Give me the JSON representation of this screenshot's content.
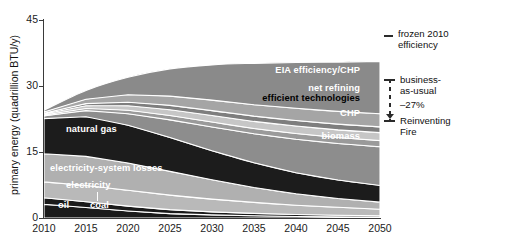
{
  "chart_data": {
    "type": "area",
    "title": "",
    "subtitle": "",
    "xlabel": "",
    "ylabel": "primary energy (quadrillion BTU/y)",
    "xlim": [
      2010,
      2050
    ],
    "ylim": [
      0,
      45
    ],
    "yticks": [
      0,
      15,
      30,
      45
    ],
    "xticks": [
      2010,
      2015,
      2020,
      2025,
      2030,
      2035,
      2040,
      2045,
      2050
    ],
    "grid": false,
    "legend_position": "right",
    "stacked": true,
    "x": [
      2010,
      2015,
      2020,
      2025,
      2030,
      2035,
      2040,
      2045,
      2050
    ],
    "series": [
      {
        "name": "coal",
        "label": "coal",
        "color": "#1a1a1a",
        "label_color": "#ffffff",
        "values": [
          3.1,
          2.4,
          1.6,
          1.0,
          0.7,
          0.5,
          0.35,
          0.25,
          0.2
        ]
      },
      {
        "name": "oil",
        "label": "oil",
        "color": "#1a1a1a",
        "label_color": "#ffffff",
        "values": [
          1.5,
          1.3,
          1.1,
          0.9,
          0.7,
          0.55,
          0.45,
          0.38,
          0.3
        ]
      },
      {
        "name": "electricity",
        "label": "electricity",
        "color": "#b9b9b9",
        "label_color": "#ffffff",
        "values": [
          3.6,
          3.7,
          3.6,
          3.3,
          2.9,
          2.5,
          2.1,
          1.8,
          1.5
        ]
      },
      {
        "name": "electricity-system losses",
        "label": "electricity-system losses",
        "color": "#b0b0b0",
        "label_color": "#ffffff",
        "values": [
          6.4,
          6.6,
          6.2,
          5.4,
          4.4,
          3.4,
          2.6,
          2.0,
          1.6
        ]
      },
      {
        "name": "natural gas",
        "label": "natural gas",
        "color": "#1c1c1c",
        "label_color": "#ffffff",
        "values": [
          8.0,
          9.0,
          8.6,
          7.7,
          6.6,
          5.6,
          4.8,
          4.2,
          3.8
        ]
      },
      {
        "name": "biomass",
        "label": "biomass",
        "color": "#8d8d8d",
        "label_color": "#ffffff",
        "values": [
          0.6,
          1.4,
          2.6,
          4.0,
          5.4,
          6.6,
          7.6,
          8.3,
          8.8
        ]
      },
      {
        "name": "CHP",
        "label": "CHP",
        "color": "#9a9a9a",
        "label_color": "#ffffff",
        "values": [
          0.2,
          0.5,
          0.8,
          1.0,
          1.1,
          1.2,
          1.3,
          1.35,
          1.4
        ]
      },
      {
        "name": "efficient technologies",
        "label": "efficient technologies",
        "color": "#c6c6c6",
        "label_color": "#000000",
        "values": [
          0.2,
          0.6,
          1.0,
          1.3,
          1.5,
          1.6,
          1.7,
          1.75,
          1.8
        ]
      },
      {
        "name": "net refining",
        "label": "net refining",
        "color": "#7e7e7e",
        "label_color": "#ffffff",
        "values": [
          0.2,
          0.5,
          0.8,
          1.0,
          1.1,
          1.2,
          1.25,
          1.3,
          1.3
        ]
      },
      {
        "name": "EIA efficiency/CHP",
        "label": "EIA efficiency/CHP",
        "color": "#a5a5a5",
        "label_color": "#ffffff",
        "values": [
          0.3,
          1.0,
          1.7,
          2.1,
          2.4,
          2.6,
          2.8,
          2.9,
          3.0
        ]
      },
      {
        "name": "EIA structural changes",
        "label": "EIA structural changes",
        "color": "#8a8a8a",
        "label_color": "#ffffff",
        "values": [
          0.4,
          2.0,
          4.0,
          6.2,
          8.0,
          9.4,
          10.4,
          11.2,
          11.9
        ]
      }
    ],
    "totals": [
      24.5,
      29.0,
      32.0,
      33.9,
      34.8,
      35.1,
      35.3,
      35.4,
      35.6
    ],
    "annotations": [
      {
        "name": "frozen-2010-efficiency",
        "text": "frozen 2010\nefficiency",
        "marker": "dash"
      },
      {
        "name": "business-as-usual",
        "text": "business-\nas-usual",
        "marker": "bracket-top"
      },
      {
        "name": "reduction-pct",
        "text": "–27%",
        "marker": "bracket-stem"
      },
      {
        "name": "reinventing-fire",
        "text": "Reinventing\nFire",
        "marker": "bracket-bottom"
      }
    ]
  },
  "axes": {
    "ytitle": "primary energy (quadrillion BTU/y)",
    "yticks": [
      "45",
      "30",
      "15",
      "0"
    ],
    "xticks": [
      "2010",
      "2015",
      "2020",
      "2025",
      "2030",
      "2035",
      "2040",
      "2045",
      "2050"
    ]
  },
  "band_labels": [
    {
      "name": "eia-structural-changes",
      "text": "EIA structural changes",
      "x": 360,
      "y": 44,
      "anchor": "end",
      "tone": "white"
    },
    {
      "name": "eia-efficiency-chp",
      "text": "EIA efficiency/CHP",
      "x": 360,
      "y": 71,
      "anchor": "end",
      "tone": "white"
    },
    {
      "name": "net-refining",
      "text": "net refining",
      "x": 360,
      "y": 89,
      "anchor": "end",
      "tone": "white"
    },
    {
      "name": "efficient-technologies",
      "text": "efficient technologies",
      "x": 360,
      "y": 99,
      "anchor": "end",
      "tone": "black"
    },
    {
      "name": "chp",
      "text": "CHP",
      "x": 360,
      "y": 114,
      "anchor": "end",
      "tone": "white"
    },
    {
      "name": "biomass",
      "text": "biomass",
      "x": 360,
      "y": 137,
      "anchor": "end",
      "tone": "white"
    },
    {
      "name": "natural-gas",
      "text": "natural gas",
      "x": 66,
      "y": 130,
      "anchor": "start",
      "tone": "white"
    },
    {
      "name": "electricity-system-losses",
      "text": "electricity-system losses",
      "x": 50,
      "y": 169,
      "anchor": "start",
      "tone": "white"
    },
    {
      "name": "electricity",
      "text": "electricity",
      "x": 66,
      "y": 186,
      "anchor": "start",
      "tone": "white"
    },
    {
      "name": "oil",
      "text": "oil",
      "x": 58,
      "y": 206,
      "anchor": "start",
      "tone": "white"
    },
    {
      "name": "coal",
      "text": "coal",
      "x": 90,
      "y": 206,
      "anchor": "start",
      "tone": "white"
    }
  ],
  "legend": {
    "frozen_efficiency": "frozen 2010\nefficiency",
    "business_as_usual": "business-\nas-usual",
    "reduction": "–27%",
    "reinventing_fire": "Reinventing\nFire"
  },
  "colors": {
    "axis": "#3a3a3a",
    "text": "#1c1c1c",
    "background": "#ffffff",
    "dark_band": "#1a1a1a",
    "mid_band": "#8a8a8a",
    "light_band": "#c6c6c6"
  }
}
